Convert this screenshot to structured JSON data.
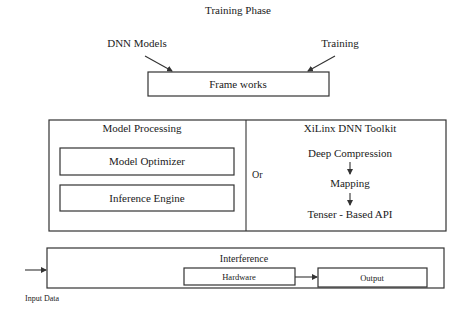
{
  "title": "Training Phase",
  "training_section": {
    "inputs": [
      "DNN Models",
      "Training"
    ],
    "frameworks_label": "Frame works"
  },
  "model_processing": {
    "title": "Model Processing",
    "items": [
      "Model Optimizer",
      "Inference Engine"
    ]
  },
  "separator_label": "Or",
  "xilinx_toolkit": {
    "title": "XiLinx DNN Toolkit",
    "steps": [
      "Deep Compression",
      "Mapping",
      "Tenser - Based API"
    ]
  },
  "inference_section": {
    "title": "Interference",
    "hardware_label": "Hardware",
    "output_label": "Output",
    "input_label": "Input Data"
  }
}
